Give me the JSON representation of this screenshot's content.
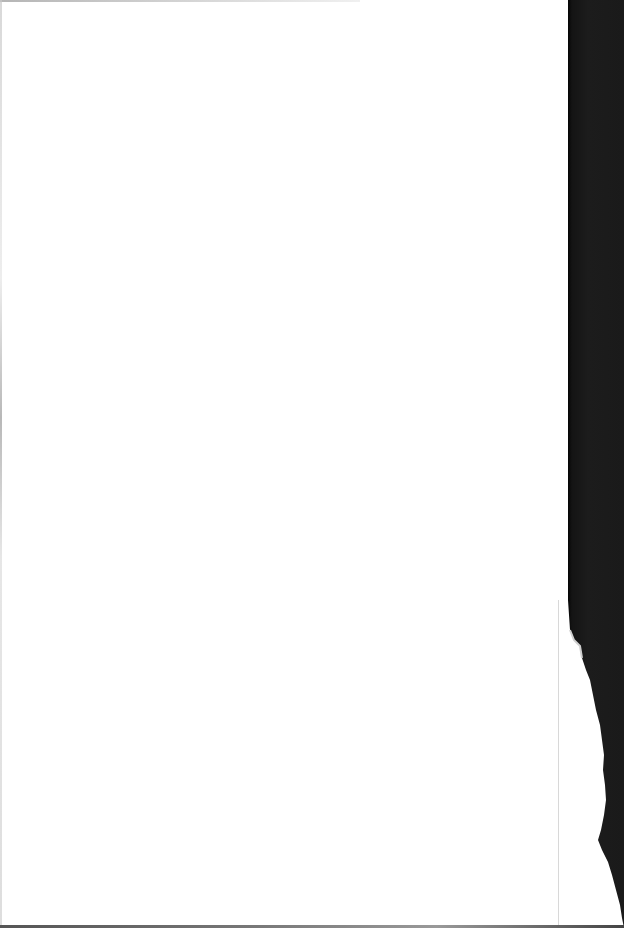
{
  "document": {
    "type": "scanned-page",
    "content": "",
    "is_blank": true
  },
  "colors": {
    "paper": "#ffffff",
    "scanner_background": "#1a1a1a",
    "edge_shadow": "#9a9a9a"
  }
}
